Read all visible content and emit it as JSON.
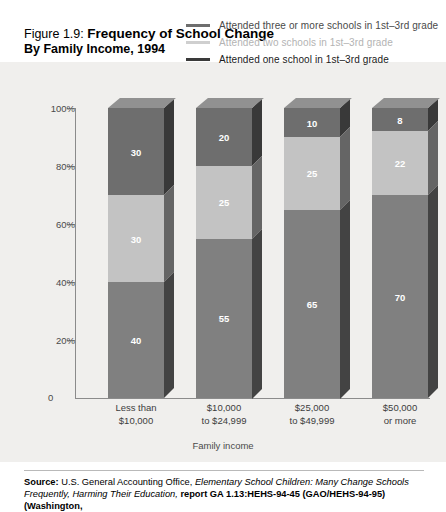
{
  "figure": {
    "prefix": "Figure 1.9:",
    "title": "Frequency of School Change",
    "subtitle": "By Family Income, 1994"
  },
  "colors": {
    "panel_bg": "#f0efed",
    "series_three_or_more": "#6e6e6e",
    "series_two": "#c3c3c3",
    "series_one": "#808080",
    "legend_three_or_more": "#6e6e6e",
    "legend_two": "#c3c3c3",
    "legend_one": "#3a3a3a",
    "axis": "#8b8b8b",
    "label_text": "#4a4a4a"
  },
  "legend": {
    "position": "top-right",
    "items": [
      {
        "label": "Attended three or more schools in 1st–3rd grade",
        "swatch": "#6e6e6e",
        "text_color": "#4a4a4a"
      },
      {
        "label": "Attended two schools in 1st–3rd grade",
        "swatch": "#c3c3c3",
        "text_color": "#b0b0b0"
      },
      {
        "label": "Attended one school in 1st–3rd grade",
        "swatch": "#3a3a3a",
        "text_color": "#1a1a1a"
      }
    ]
  },
  "chart_data": {
    "type": "bar",
    "stacked": true,
    "render_style": "3d-stacked-column",
    "title": "Frequency of School Change",
    "subtitle": "By Family Income, 1994",
    "xlabel": "Family income",
    "ylabel": "",
    "ylim": [
      0,
      100
    ],
    "grid": false,
    "legend_position": "top-right",
    "categories": [
      "Less than $10,000",
      "$10,000 to $24,999",
      "$25,000 to $49,999",
      "$50,000 or more"
    ],
    "category_lines": [
      [
        "Less than",
        "$10,000"
      ],
      [
        "$10,000",
        "to $24,999"
      ],
      [
        "$25,000",
        "to $49,999"
      ],
      [
        "$50,000",
        "or more"
      ]
    ],
    "ytick_labels": [
      "0",
      "20%",
      "40%",
      "60%",
      "80%",
      "100%"
    ],
    "ytick_values": [
      0,
      20,
      40,
      60,
      80,
      100
    ],
    "series": [
      {
        "name": "Attended one school in 1st–3rd grade",
        "color": "#808080",
        "values": [
          40,
          55,
          65,
          70
        ]
      },
      {
        "name": "Attended two schools in 1st–3rd grade",
        "color": "#c3c3c3",
        "values": [
          30,
          25,
          25,
          22
        ]
      },
      {
        "name": "Attended three or more schools in 1st–3rd grade",
        "color": "#6e6e6e",
        "values": [
          30,
          20,
          10,
          8
        ]
      }
    ]
  },
  "axis": {
    "x_title": "Family income",
    "zero_label": "0"
  },
  "source": {
    "label": "Source:",
    "part1": " U.S. General Accounting Office, ",
    "italic1": "Elementary School Children: Many Change Schools Frequently, Harming Their Education,",
    "part2": " ",
    "bold2": "report GA 1.13:HEHS-94-45 (GAO/HEHS-94-95) (Washington,"
  }
}
